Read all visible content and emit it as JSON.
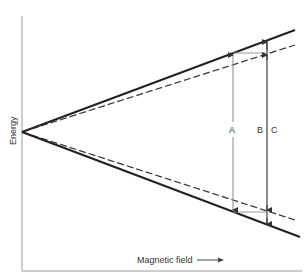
{
  "diagram": {
    "axes": {
      "y_label": "Energy",
      "x_label": "Magnetic field"
    },
    "markers": {
      "a": "A",
      "b": "B",
      "c": "C"
    },
    "lines": [
      {
        "name": "upper-solid",
        "style": "solid"
      },
      {
        "name": "upper-dashed",
        "style": "dashed"
      },
      {
        "name": "lower-dashed",
        "style": "dashed"
      },
      {
        "name": "lower-solid",
        "style": "solid"
      }
    ],
    "colors": {
      "line": "#222222",
      "axis": "#888888",
      "guide": "#999999"
    }
  }
}
